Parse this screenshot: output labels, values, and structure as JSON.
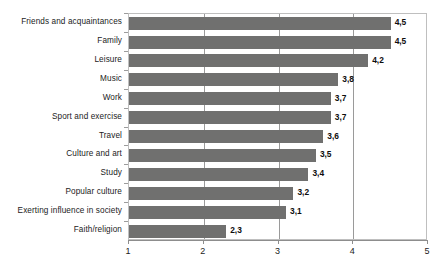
{
  "chart_data": {
    "type": "bar",
    "orientation": "horizontal",
    "title": "",
    "subtitle": "",
    "xlabel": "",
    "ylabel": "",
    "xlim": [
      1,
      5
    ],
    "grid": true,
    "gridlines_x": [
      2,
      3,
      4
    ],
    "legend": null,
    "decimal_separator": ",",
    "xticks": [
      "1",
      "2",
      "3",
      "4",
      "5"
    ],
    "xtick_values": [
      1,
      2,
      3,
      4,
      5
    ],
    "categories": [
      "Friends and acquaintances",
      "Family",
      "Leisure",
      "Music",
      "Work",
      "Sport and exercise",
      "Travel",
      "Culture and art",
      "Study",
      "Popular culture",
      "Exerting influence in society",
      "Faith/religion"
    ],
    "values": [
      4.5,
      4.5,
      4.2,
      3.8,
      3.7,
      3.7,
      3.6,
      3.5,
      3.4,
      3.2,
      3.1,
      2.3
    ],
    "value_labels": [
      "4,5",
      "4,5",
      "4,2",
      "3,8",
      "3,7",
      "3,7",
      "3,6",
      "3,5",
      "3,4",
      "3,2",
      "3,1",
      "2,3"
    ],
    "bar_color": "#70706f",
    "plot_border_color": "#bfbfbf",
    "axis_color": "#8d8d8d",
    "gridline_color": "#9a9a9a",
    "background_color": "#ffffff",
    "text_color": "#1b1b1b"
  }
}
